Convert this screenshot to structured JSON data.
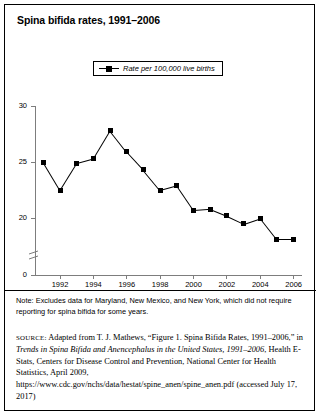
{
  "figure": {
    "title": "Spina bifida rates, 1991–2006",
    "legend_label": "Rate per 100,000 live births",
    "note": "Note: Excludes data for Maryland, New Mexico, and New York, which did not require reporting for spina bifida for some years.",
    "source_prefix": "SOURCE:",
    "source_part1": " Adapted from T. J. Mathews, “Figure 1. Spina Bifida Rates, 1991–2006,” in ",
    "source_italic1": "Trends in Spina Bifida and Anencephalus in the United States, 1991–2006",
    "source_part2": ", Health E-Stats, Centers for Disease Control and Prevention, National Center for Health Statistics, April 2009, https://www.cdc.gov/nchs/data/hestat/spine_anen/spine_anen.pdf (accessed July 17, 2017)"
  },
  "chart_data": {
    "type": "line",
    "title": "Spina bifida rates, 1991–2006",
    "xlabel": "",
    "ylabel": "",
    "legend": [
      "Rate per 100,000 live births"
    ],
    "legend_position": "top-center",
    "grid": false,
    "axis_break": true,
    "x": [
      1991,
      1992,
      1993,
      1994,
      1995,
      1996,
      1997,
      1998,
      1999,
      2000,
      2001,
      2002,
      2003,
      2004,
      2005,
      2006
    ],
    "xtick_labels": [
      "1992",
      "1994",
      "1996",
      "1998",
      "2000",
      "2002",
      "2004",
      "2006"
    ],
    "xticks": [
      1992,
      1994,
      1996,
      1998,
      2000,
      2002,
      2004,
      2006
    ],
    "xlim": [
      1990.5,
      2006.5
    ],
    "ytick_labels": [
      "0",
      "20",
      "25",
      "30"
    ],
    "yticks": [
      0,
      20,
      25,
      30
    ],
    "ylim": [
      18,
      30
    ],
    "series": [
      {
        "name": "Rate per 100,000 live births",
        "values": [
          25.0,
          22.5,
          24.9,
          25.3,
          27.8,
          25.9,
          24.3,
          22.5,
          22.9,
          20.7,
          20.8,
          20.2,
          19.5,
          20.0,
          18.1,
          18.1
        ],
        "color": "#000000",
        "marker": "square"
      }
    ]
  }
}
